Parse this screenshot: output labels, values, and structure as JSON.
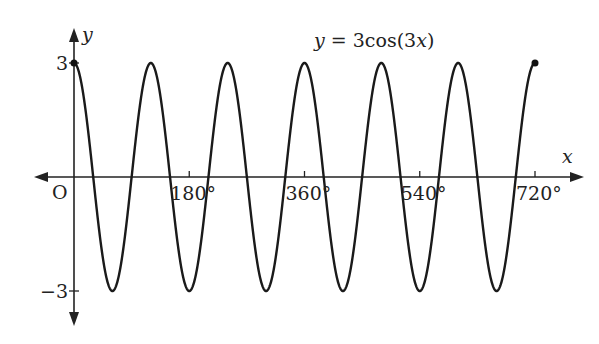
{
  "chart_data": {
    "type": "line",
    "title": "y = 3cos(3x)",
    "equation_label": "y = 3cos(3x)",
    "xlabel": "x",
    "ylabel": "y",
    "origin_label": "O",
    "x_ticks": [
      180,
      360,
      540,
      720
    ],
    "x_tick_labels": [
      "180°",
      "360°",
      "540°",
      "720°"
    ],
    "y_ticks": [
      3,
      -3
    ],
    "y_tick_labels": [
      "3",
      "−3"
    ],
    "xlim": [
      0,
      720
    ],
    "ylim": [
      -3,
      3
    ],
    "amplitude": 3,
    "frequency": 3,
    "endpoints": [
      {
        "x": 0,
        "y": 3
      },
      {
        "x": 720,
        "y": 3
      }
    ],
    "grid": false,
    "line_color": "#1a1a1a"
  }
}
